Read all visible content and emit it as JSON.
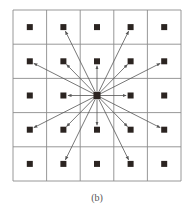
{
  "figure": {
    "caption": "(b)",
    "grid": {
      "rows": 5,
      "cols": 5,
      "x0": 13,
      "y0": 10,
      "x1": 181,
      "y1": 181,
      "line_color": "#8c8c8c"
    },
    "node_color": "#2b2421",
    "edge_color": "#555555",
    "center": [
      2,
      2
    ],
    "targets": [
      [
        0,
        1
      ],
      [
        0,
        3
      ],
      [
        1,
        0
      ],
      [
        1,
        1
      ],
      [
        1,
        2
      ],
      [
        1,
        3
      ],
      [
        1,
        4
      ],
      [
        2,
        1
      ],
      [
        2,
        3
      ],
      [
        3,
        0
      ],
      [
        3,
        1
      ],
      [
        3,
        2
      ],
      [
        3,
        3
      ],
      [
        3,
        4
      ],
      [
        4,
        1
      ],
      [
        4,
        3
      ]
    ]
  }
}
